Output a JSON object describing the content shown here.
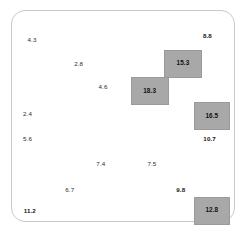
{
  "chart_data": {
    "type": "scatter",
    "title": "",
    "subtitle": "",
    "xlabel": "",
    "ylabel": "",
    "grid": false,
    "legend": "none",
    "xlim": [
      0,
      100
    ],
    "ylim": [
      0,
      100
    ],
    "highlight_color": "#a8a8a8",
    "text_color": "#2b2b2b",
    "panel_border_color": "#c9c9c9",
    "points": [
      {
        "label": "4.3",
        "value": 4.3,
        "x": 9,
        "y": 14,
        "style": "plain"
      },
      {
        "label": "8.8",
        "value": 8.8,
        "x": 88,
        "y": 12,
        "style": "bold"
      },
      {
        "label": "2.8",
        "value": 2.8,
        "x": 30,
        "y": 25,
        "style": "plain"
      },
      {
        "label": "4.6",
        "value": 4.6,
        "x": 41,
        "y": 36,
        "style": "plain"
      },
      {
        "label": "2.4",
        "value": 2.4,
        "x": 7,
        "y": 49,
        "style": "plain"
      },
      {
        "label": "5.6",
        "value": 5.6,
        "x": 7,
        "y": 61,
        "style": "plain"
      },
      {
        "label": "10.7",
        "value": 10.7,
        "x": 89,
        "y": 61,
        "style": "bold"
      },
      {
        "label": "7.4",
        "value": 7.4,
        "x": 40,
        "y": 73,
        "style": "plain"
      },
      {
        "label": "7.5",
        "value": 7.5,
        "x": 63,
        "y": 73,
        "style": "plain"
      },
      {
        "label": "6.7",
        "value": 6.7,
        "x": 26,
        "y": 85,
        "style": "plain"
      },
      {
        "label": "9.8",
        "value": 9.8,
        "x": 76,
        "y": 85,
        "style": "bold"
      },
      {
        "label": "11.2",
        "value": 11.2,
        "x": 8,
        "y": 95,
        "style": "bold"
      }
    ],
    "highlighted_cells": [
      {
        "label": "15.3",
        "value": 15.3,
        "x": 77,
        "y": 25,
        "w": 38,
        "h": 28
      },
      {
        "label": "18.3",
        "value": 18.3,
        "x": 62,
        "y": 38,
        "w": 38,
        "h": 28
      },
      {
        "label": "16.5",
        "value": 16.5,
        "x": 90,
        "y": 50,
        "w": 36,
        "h": 28
      },
      {
        "label": "12.8",
        "value": 12.8,
        "x": 90,
        "y": 95,
        "w": 36,
        "h": 28
      }
    ]
  }
}
